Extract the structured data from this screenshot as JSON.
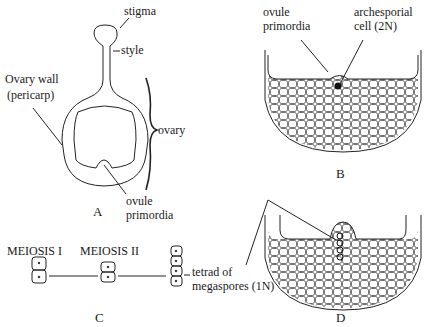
{
  "figure": {
    "panels": [
      {
        "id": "A",
        "label": "A"
      },
      {
        "id": "B",
        "label": "B"
      },
      {
        "id": "C",
        "label": "C"
      },
      {
        "id": "D",
        "label": "D"
      }
    ],
    "panel_a": {
      "stigma": "stigma",
      "style": "style",
      "ovary_wall_1": "Ovary wall",
      "ovary_wall_2": "(pericarp)",
      "ovary": "ovary",
      "ovule_1": "ovule",
      "ovule_2": "primordia"
    },
    "panel_b": {
      "ovule_1": "ovule",
      "ovule_2": "primordia",
      "archesporial_1": "archesporial",
      "archesporial_2": "cell (2N)"
    },
    "panel_c": {
      "meiosis1": "MEIOSIS I",
      "meiosis2": "MEIOSIS II",
      "tetrad_1": "tetrad of",
      "tetrad_2": "megaspores (1N)"
    }
  }
}
